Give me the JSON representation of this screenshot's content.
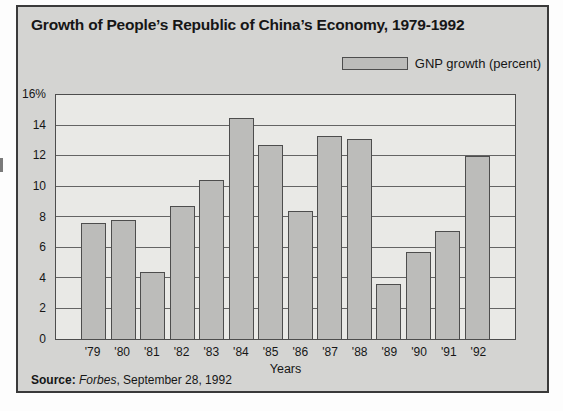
{
  "figure": {
    "title": "Growth of People’s Republic of China’s Economy, 1979-1992",
    "legend": {
      "label": "GNP growth (percent)"
    },
    "source": {
      "label": "Source:",
      "publication": "Forbes",
      "rest": ", September 28, 1992"
    }
  },
  "chart_data": {
    "type": "bar",
    "categories": [
      "'79",
      "'80",
      "'81",
      "'82",
      "'83",
      "'84",
      "'85",
      "'86",
      "'87",
      "'88",
      "'89",
      "'90",
      "'91",
      "'92"
    ],
    "values": [
      7.6,
      7.8,
      4.4,
      8.7,
      10.4,
      14.5,
      12.7,
      8.4,
      13.3,
      13.1,
      3.6,
      5.7,
      7.1,
      12
    ],
    "series_name": "GNP growth (percent)",
    "xlabel": "Years",
    "ylabel": "",
    "ylim": [
      0,
      16
    ],
    "ytick_interval": 2,
    "ytick_labels": [
      "0",
      "2",
      "4",
      "6",
      "8",
      "10",
      "12",
      "14",
      "16%"
    ],
    "grid": true,
    "legend_position": "top-right"
  },
  "colors": {
    "page_bg": "#fdfdfd",
    "panel_bg": "#d4d4d2",
    "plot_bg": "#e9e9e6",
    "bar_fill": "#bcbcba",
    "line_dark": "#3a3a3a",
    "line_mid": "#4d4d4d",
    "grid_line": "#646464",
    "text": "#161616"
  }
}
